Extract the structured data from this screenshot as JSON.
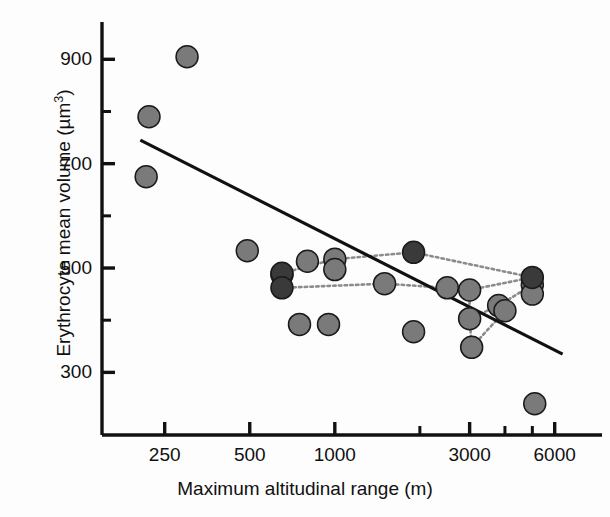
{
  "chart_data": {
    "type": "scatter",
    "title": "",
    "xlabel": "Maximum altitudinal range (m)",
    "ylabel_parts": {
      "main": "Erythrocyte mean volume (µm",
      "sup": "3",
      "tail": ")"
    },
    "ylabel": "Erythrocyte mean volume (µm3)",
    "x_scale": "log",
    "y_scale": "linear",
    "xlim": [
      150,
      8000
    ],
    "ylim": [
      180,
      960
    ],
    "grid": false,
    "legend": null,
    "x_ticks": [
      {
        "value": 250,
        "label": "250",
        "major": true
      },
      {
        "value": 500,
        "label": "500",
        "major": true
      },
      {
        "value": 1000,
        "label": "1000",
        "major": true
      },
      {
        "value": 2000,
        "label": "",
        "major": false
      },
      {
        "value": 3000,
        "label": "3000",
        "major": true
      },
      {
        "value": 4000,
        "label": "",
        "major": false
      },
      {
        "value": 5000,
        "label": "",
        "major": false
      },
      {
        "value": 6000,
        "label": "6000",
        "major": true
      }
    ],
    "y_ticks": [
      {
        "value": 900,
        "label": "900",
        "major": true
      },
      {
        "value": 800,
        "label": "",
        "major": false
      },
      {
        "value": 700,
        "label": "700",
        "major": true
      },
      {
        "value": 600,
        "label": "",
        "major": false
      },
      {
        "value": 500,
        "label": "500",
        "major": true
      },
      {
        "value": 400,
        "label": "",
        "major": false
      },
      {
        "value": 300,
        "label": "300",
        "major": true
      }
    ],
    "marker": {
      "shape": "circle",
      "radius_px": 11,
      "edge_color": "#1a1a1a",
      "edge_width_px": 1.5
    },
    "series": [
      {
        "name": "light-gray points",
        "color": "#7a7a7a",
        "points": [
          {
            "x": 300,
            "y": 905
          },
          {
            "x": 220,
            "y": 790
          },
          {
            "x": 215,
            "y": 675
          },
          {
            "x": 490,
            "y": 533
          },
          {
            "x": 800,
            "y": 513
          },
          {
            "x": 1000,
            "y": 517
          },
          {
            "x": 1000,
            "y": 497
          },
          {
            "x": 650,
            "y": 487
          },
          {
            "x": 1500,
            "y": 470
          },
          {
            "x": 2500,
            "y": 462
          },
          {
            "x": 3000,
            "y": 458
          },
          {
            "x": 5000,
            "y": 468
          },
          {
            "x": 5000,
            "y": 450
          },
          {
            "x": 3800,
            "y": 428
          },
          {
            "x": 4000,
            "y": 418
          },
          {
            "x": 3000,
            "y": 403
          },
          {
            "x": 750,
            "y": 392
          },
          {
            "x": 950,
            "y": 392
          },
          {
            "x": 1900,
            "y": 378
          },
          {
            "x": 3050,
            "y": 348
          },
          {
            "x": 5100,
            "y": 240
          }
        ]
      },
      {
        "name": "dark-gray points",
        "color": "#3a3a3a",
        "points": [
          {
            "x": 650,
            "y": 490
          },
          {
            "x": 650,
            "y": 462
          },
          {
            "x": 1900,
            "y": 530
          },
          {
            "x": 5000,
            "y": 482
          }
        ]
      }
    ],
    "connector_lines": {
      "style": "dotted",
      "color": "#8c8c8c",
      "segments": [
        [
          {
            "x": 650,
            "y": 490
          },
          {
            "x": 1000,
            "y": 517
          }
        ],
        [
          {
            "x": 1000,
            "y": 517
          },
          {
            "x": 1900,
            "y": 530
          }
        ],
        [
          {
            "x": 1900,
            "y": 530
          },
          {
            "x": 5000,
            "y": 482
          }
        ],
        [
          {
            "x": 650,
            "y": 462
          },
          {
            "x": 1500,
            "y": 470
          }
        ],
        [
          {
            "x": 1500,
            "y": 470
          },
          {
            "x": 2500,
            "y": 462
          }
        ],
        [
          {
            "x": 2500,
            "y": 462
          },
          {
            "x": 3000,
            "y": 458
          }
        ],
        [
          {
            "x": 3000,
            "y": 458
          },
          {
            "x": 5000,
            "y": 482
          }
        ],
        [
          {
            "x": 3000,
            "y": 458
          },
          {
            "x": 3000,
            "y": 403
          }
        ],
        [
          {
            "x": 3000,
            "y": 403
          },
          {
            "x": 3800,
            "y": 428
          }
        ],
        [
          {
            "x": 3800,
            "y": 428
          },
          {
            "x": 5000,
            "y": 468
          }
        ],
        [
          {
            "x": 3000,
            "y": 403
          },
          {
            "x": 3050,
            "y": 348
          }
        ],
        [
          {
            "x": 3050,
            "y": 348
          },
          {
            "x": 4000,
            "y": 418
          }
        ]
      ]
    },
    "regression_line": {
      "color": "#111111",
      "width_px": 3.2,
      "start": {
        "x": 205,
        "y": 745
      },
      "end": {
        "x": 6400,
        "y": 335
      }
    }
  }
}
